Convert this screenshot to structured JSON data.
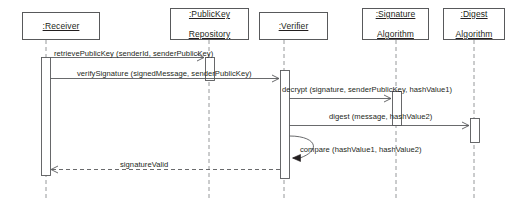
{
  "diagram": {
    "type": "uml-sequence-diagram",
    "colors": {
      "stroke": "#58595b",
      "text": "#231f20",
      "background": "#ffffff",
      "activation_fill": "#ffffff"
    },
    "lifelines": [
      {
        "id": "receiver",
        "name": ":Receiver",
        "lines": [
          ":Receiver"
        ],
        "box": {
          "x": 22,
          "y": 12,
          "w": 78,
          "h": 28
        },
        "lifeline_x": 46,
        "activation": {
          "x": 41,
          "y": 57,
          "w": 9,
          "h": 118
        }
      },
      {
        "id": "publickey-repository",
        "name": ":PublicKey Repository",
        "lines": [
          ":PublicKey",
          "Repository"
        ],
        "box": {
          "x": 170,
          "y": 8,
          "w": 79,
          "h": 32
        },
        "lifeline_x": 209,
        "activation": {
          "x": 205,
          "y": 57,
          "w": 9,
          "h": 23
        }
      },
      {
        "id": "verifier",
        "name": ":Verifier",
        "lines": [
          ":Verifier"
        ],
        "box": {
          "x": 259,
          "y": 12,
          "w": 69,
          "h": 28
        },
        "lifeline_x": 284,
        "activation": {
          "x": 280,
          "y": 70,
          "w": 9,
          "h": 108
        }
      },
      {
        "id": "signature-algorithm",
        "name": ":Signature Algorithm",
        "lines": [
          ":Signature",
          "Algorithm"
        ],
        "box": {
          "x": 362,
          "y": 8,
          "w": 67,
          "h": 32
        },
        "lifeline_x": 396,
        "activation": {
          "x": 392,
          "y": 91,
          "w": 9,
          "h": 34
        }
      },
      {
        "id": "digest-algorithm",
        "name": ":Digest Algorithm",
        "lines": [
          ":Digest",
          "Algorithm"
        ],
        "box": {
          "x": 443,
          "y": 8,
          "w": 62,
          "h": 32
        },
        "lifeline_x": 474,
        "activation": {
          "x": 470,
          "y": 118,
          "w": 9,
          "h": 24
        }
      }
    ],
    "messages": [
      {
        "id": "m1",
        "label": "retrievePublicKey (senderId, senderPublicKey)",
        "from": "receiver",
        "to": "publickey-repository",
        "x1": 50,
        "x2": 205,
        "y": 57,
        "style": "solid",
        "arrow": "open",
        "kind": "call",
        "label_x": 54,
        "label_y": 49
      },
      {
        "id": "m2",
        "label": "verifySignature (signedMessage, senderPublicKey)",
        "from": "receiver",
        "to": "verifier",
        "x1": 50,
        "x2": 280,
        "y": 78,
        "style": "solid",
        "arrow": "open",
        "kind": "call",
        "label_x": 77,
        "label_y": 69
      },
      {
        "id": "m3",
        "label": "decrypt (signature, senderPublicKey, hashValue1)",
        "from": "verifier",
        "to": "signature-algorithm",
        "x1": 289,
        "x2": 392,
        "y": 98,
        "style": "solid",
        "arrow": "open",
        "kind": "call",
        "label_x": 282,
        "label_y": 85
      },
      {
        "id": "m4",
        "label": "digest (message, hashValue2)",
        "from": "verifier",
        "to": "digest-algorithm",
        "x1": 289,
        "x2": 470,
        "y": 125,
        "style": "solid",
        "arrow": "open",
        "kind": "call",
        "label_x": 329,
        "label_y": 112
      },
      {
        "id": "m5",
        "label": "compare (hashValue1, hashValue2)",
        "from": "verifier",
        "to": "verifier",
        "y": 142,
        "style": "solid",
        "arrow": "filled",
        "kind": "self-call",
        "label_x": 300,
        "label_y": 145
      },
      {
        "id": "m6",
        "label": "signatureValid",
        "from": "verifier",
        "to": "receiver",
        "x1": 280,
        "x2": 50,
        "y": 169,
        "style": "dashed",
        "arrow": "open",
        "kind": "return",
        "label_x": 120,
        "label_y": 160
      }
    ]
  }
}
